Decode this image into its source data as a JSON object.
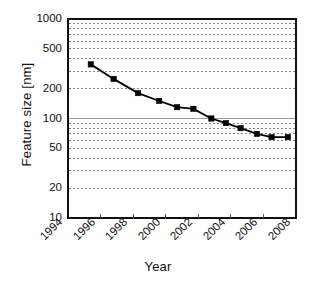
{
  "chart_data": {
    "type": "line",
    "title": "",
    "subtitle": "",
    "xlabel": "Year",
    "ylabel": "Feature size [nm]",
    "yscale": "log",
    "xscale": "linear",
    "xlim": [
      1994,
      2008
    ],
    "ylim": [
      10,
      1000
    ],
    "grid": true,
    "grid_style": "dotted horizontal minor + major, solid line at 100",
    "legend": "none",
    "marker": "square",
    "marker_color": "#000000",
    "line_color": "#000000",
    "x_ticklabels": [
      "1994",
      "1996",
      "1998",
      "2000",
      "2002",
      "2004",
      "2006",
      "2008"
    ],
    "x_ticks": [
      1994,
      1996,
      1998,
      2000,
      2002,
      2004,
      2006,
      2008
    ],
    "y_ticklabels": [
      "1000",
      "500",
      "200",
      "100",
      "50",
      "20",
      "10"
    ],
    "y_ticks": [
      1000,
      500,
      200,
      100,
      50,
      20,
      10
    ],
    "series": [
      {
        "name": "Feature size",
        "x": [
          1995.4,
          1996.8,
          1998.3,
          1999.6,
          2000.7,
          2001.7,
          2002.8,
          2003.7,
          2004.6,
          2005.6,
          2006.5,
          2007.5
        ],
        "values": [
          350,
          250,
          180,
          150,
          130,
          125,
          100,
          90,
          80,
          70,
          65,
          65
        ]
      }
    ]
  },
  "axes": {
    "x_title": "Year",
    "y_title": "Feature size [nm]"
  }
}
